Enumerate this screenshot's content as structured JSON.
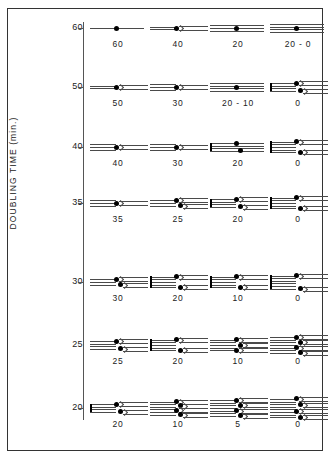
{
  "figure": {
    "axis_title": "DOUBLING  TIME  (min.)",
    "y_ticks": [
      "60",
      "50",
      "40",
      "35",
      "30",
      "25",
      "20"
    ],
    "columns": 4,
    "rows": 7
  },
  "chart_data": {
    "type": "diagram",
    "title": "",
    "ylabel": "DOUBLING TIME (min.)",
    "xlabel": "",
    "ylim": [
      20,
      60
    ],
    "grid": false,
    "legend": "none",
    "y_tick_values": [
      60,
      50,
      40,
      35,
      30,
      25,
      20
    ],
    "y_tick_labels": [
      "60",
      "50",
      "40",
      "35",
      "30",
      "25",
      "20"
    ],
    "rows": [
      {
        "doubling_time": "60",
        "y": 28,
        "cells": [
          {
            "label": "60",
            "forks": 1,
            "strands": 1,
            "branches": 0
          },
          {
            "label": "40",
            "forks": 1,
            "strands": 2,
            "branches": 1
          },
          {
            "label": "20",
            "forks": 0,
            "strands": 3,
            "branches": 0
          },
          {
            "label": "20 - 0",
            "forks": 0,
            "strands": 4,
            "branches": 0
          }
        ]
      },
      {
        "doubling_time": "50",
        "y": 87,
        "cells": [
          {
            "label": "50",
            "forks": 1,
            "strands": 2,
            "branches": 1
          },
          {
            "label": "30",
            "forks": 1,
            "strands": 3,
            "branches": 1
          },
          {
            "label": "20 - 10",
            "forks": 0,
            "strands": 4,
            "branches": 0
          },
          {
            "label": "0",
            "forks": 2,
            "strands": 4,
            "branches": 2
          }
        ]
      },
      {
        "doubling_time": "40",
        "y": 147,
        "cells": [
          {
            "label": "40",
            "forks": 1,
            "strands": 3,
            "branches": 1
          },
          {
            "label": "30",
            "forks": 1,
            "strands": 3,
            "branches": 1
          },
          {
            "label": "20",
            "forks": 2,
            "strands": 4,
            "branches": 0
          },
          {
            "label": "0",
            "forks": 2,
            "strands": 5,
            "branches": 2
          }
        ]
      },
      {
        "doubling_time": "35",
        "y": 203,
        "cells": [
          {
            "label": "35",
            "forks": 1,
            "strands": 3,
            "branches": 1
          },
          {
            "label": "25",
            "forks": 2,
            "strands": 3,
            "branches": 1
          },
          {
            "label": "20",
            "forks": 2,
            "strands": 4,
            "branches": 2
          },
          {
            "label": "0",
            "forks": 2,
            "strands": 5,
            "branches": 2
          }
        ]
      },
      {
        "doubling_time": "30",
        "y": 282,
        "cells": [
          {
            "label": "30",
            "forks": 2,
            "strands": 3,
            "branches": 1
          },
          {
            "label": "20",
            "forks": 2,
            "strands": 5,
            "branches": 2
          },
          {
            "label": "10",
            "forks": 2,
            "strands": 5,
            "branches": 2
          },
          {
            "label": "0",
            "forks": 2,
            "strands": 6,
            "branches": 2
          }
        ]
      },
      {
        "doubling_time": "25",
        "y": 345,
        "cells": [
          {
            "label": "25",
            "forks": 2,
            "strands": 4,
            "branches": 3
          },
          {
            "label": "20",
            "forks": 2,
            "strands": 5,
            "branches": 2
          },
          {
            "label": "10",
            "forks": 3,
            "strands": 5,
            "branches": 3
          },
          {
            "label": "0",
            "forks": 4,
            "strands": 7,
            "branches": 6
          }
        ]
      },
      {
        "doubling_time": "20",
        "y": 408,
        "cells": [
          {
            "label": "20",
            "forks": 2,
            "strands": 4,
            "branches": 1
          },
          {
            "label": "10",
            "forks": 4,
            "strands": 6,
            "branches": 5
          },
          {
            "label": "5",
            "forks": 4,
            "strands": 7,
            "branches": 5
          },
          {
            "label": "0",
            "forks": 4,
            "strands": 8,
            "branches": 4
          }
        ]
      }
    ]
  }
}
